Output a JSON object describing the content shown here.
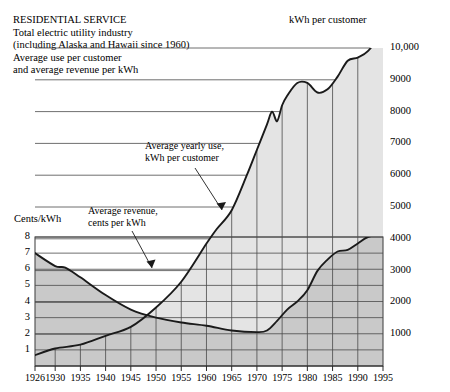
{
  "caption": {
    "lines": [
      "RESIDENTIAL SERVICE",
      "Total electric utility industry",
      "(including Alaska and Hawaii since 1960)",
      "Average use per customer",
      "and average revenue per kWh"
    ]
  },
  "axes": {
    "right_title": "kWh per customer",
    "left_title": "Cents/kWh"
  },
  "annotations": {
    "use": [
      "Average yearly use,",
      "kWh per customer"
    ],
    "revenue": [
      "Average revenue,",
      "cents per kWh"
    ]
  },
  "colors": {
    "fill_light": "#e2e2e2",
    "fill_dark": "#c9c9c9",
    "line": "#1a1a1a",
    "grid": "#3a3a3a",
    "background": "#ffffff"
  },
  "chart_data": {
    "type": "line",
    "title": "RESIDENTIAL SERVICE",
    "subtitle": "Total electric utility industry (including Alaska and Hawaii since 1960) Average use per customer and average revenue per kWh",
    "xlabel": "",
    "x_ticks": [
      1926,
      1930,
      1935,
      1940,
      1945,
      1950,
      1955,
      1960,
      1965,
      1970,
      1975,
      1980,
      1985,
      1990,
      1995
    ],
    "xlim": [
      1926,
      1995
    ],
    "grid": true,
    "legend": "none",
    "axes": [
      {
        "id": "right",
        "name": "kWh per customer",
        "position": "right",
        "ylim": [
          0,
          10000
        ],
        "ticks": [
          1000,
          2000,
          3000,
          4000,
          5000,
          6000,
          7000,
          8000,
          9000,
          10000
        ],
        "tick_labels": [
          "1000",
          "2000",
          "3000",
          "4000",
          "5000",
          "6000",
          "7000",
          "8000",
          "9000",
          "10,000"
        ]
      },
      {
        "id": "left",
        "name": "Cents/kWh",
        "position": "left",
        "ylim": [
          0,
          8
        ],
        "ticks": [
          1,
          2,
          3,
          4,
          5,
          6,
          7,
          8
        ],
        "tick_labels": [
          "1",
          "2",
          "3",
          "4",
          "5",
          "6",
          "7",
          "8"
        ]
      }
    ],
    "series": [
      {
        "name": "Average yearly use, kWh per customer",
        "axis": "right",
        "units": "kWh",
        "x": [
          1926,
          1930,
          1935,
          1940,
          1945,
          1950,
          1955,
          1960,
          1962,
          1965,
          1968,
          1970,
          1972,
          1973,
          1974,
          1975,
          1976,
          1978,
          1980,
          1982,
          1984,
          1986,
          1988,
          1990,
          1992,
          1995
        ],
        "values": [
          340,
          550,
          670,
          950,
          1230,
          1840,
          2650,
          3850,
          4300,
          4900,
          6000,
          6800,
          7600,
          8000,
          7700,
          8200,
          8500,
          8900,
          8900,
          8600,
          8700,
          9100,
          9600,
          9700,
          9900,
          10500
        ]
      },
      {
        "name": "Average revenue, cents per kWh",
        "axis": "left",
        "units": "cents/kWh",
        "x": [
          1926,
          1930,
          1932,
          1935,
          1940,
          1945,
          1950,
          1955,
          1960,
          1965,
          1970,
          1972,
          1974,
          1976,
          1978,
          1980,
          1982,
          1984,
          1986,
          1988,
          1990,
          1992,
          1995
        ],
        "values": [
          7.0,
          6.2,
          6.1,
          5.5,
          4.4,
          3.5,
          3.0,
          2.7,
          2.5,
          2.2,
          2.1,
          2.2,
          2.8,
          3.5,
          4.0,
          4.7,
          5.9,
          6.6,
          7.1,
          7.2,
          7.6,
          8.0,
          8.2
        ]
      }
    ]
  },
  "x_tick_labels": [
    "1926",
    "1930",
    "1935",
    "1940",
    "1945",
    "1950",
    "1955",
    "1960",
    "1965",
    "1970",
    "1975",
    "1980",
    "1985",
    "1990",
    "1995"
  ],
  "right_tick_labels": [
    "10,000",
    "9000",
    "8000",
    "7000",
    "6000",
    "5000",
    "4000",
    "3000",
    "2000",
    "1000"
  ],
  "left_tick_labels": [
    "8",
    "7",
    "6",
    "5",
    "4",
    "3",
    "2",
    "1"
  ]
}
